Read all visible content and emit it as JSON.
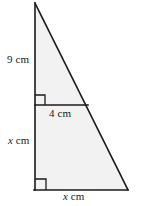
{
  "figure": {
    "type": "geometry-diagram",
    "background_color": "#ffffff",
    "fill_color": "#f2f2f2",
    "stroke_color": "#1a1a1a",
    "labels": {
      "left_upper": {
        "value": "9",
        "unit": "cm",
        "full": "9 cm"
      },
      "inner_horizontal": {
        "value": "4",
        "unit": "cm",
        "full": "4 cm"
      },
      "left_lower": {
        "value": "x",
        "unit": "cm",
        "full": "x cm"
      },
      "bottom": {
        "value": "x",
        "unit": "cm",
        "full": "x cm"
      }
    },
    "vertices": {
      "apex": {
        "x": 35,
        "y": 3
      },
      "bottom_left": {
        "x": 35,
        "y": 190
      },
      "bottom_right": {
        "x": 128,
        "y": 190
      },
      "divider_left": {
        "x": 35,
        "y": 105
      },
      "divider_right": {
        "x": 88,
        "y": 105
      }
    },
    "right_angles": [
      {
        "name": "inner-right-angle",
        "x": 35,
        "y": 105,
        "opens": "up-right"
      },
      {
        "name": "bottom-left-right-angle",
        "x": 35,
        "y": 190,
        "opens": "up-right"
      }
    ]
  }
}
